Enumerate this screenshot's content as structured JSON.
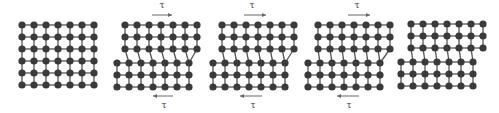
{
  "figure": {
    "stress_symbol": "τ",
    "colors": {
      "atom": "#3a3a3a",
      "bond": "#555555",
      "arrow": "#666666",
      "background": "#ffffff"
    },
    "atom_radius": 3.6,
    "spacing": 12
  },
  "panels": [
    {
      "name": "panel-perfect-lattice",
      "shear": false,
      "top_rows": {
        "x0": 22,
        "y0": 25,
        "cols": 7,
        "rows": 3
      },
      "bottom_rows": {
        "x0": 22,
        "y0": 61,
        "cols": 7,
        "rows": 3
      },
      "extra_half_plane_col": null
    },
    {
      "name": "panel-dislocation-enters",
      "shear": true,
      "tau_top": {
        "label": "τ",
        "x": 162,
        "y": 8,
        "arrow_x1": 152,
        "arrow_x2": 172,
        "arrow_y": 15,
        "dir": "right"
      },
      "tau_bottom": {
        "label": "τ",
        "x": 164,
        "y": 108,
        "arrow_x1": 153,
        "arrow_x2": 173,
        "arrow_y": 96,
        "dir": "left"
      },
      "top_rows": {
        "x0": 125,
        "y0": 25,
        "cols": 7,
        "rows": 3
      },
      "bottom_rows": {
        "x0": 117,
        "y0": 63,
        "cols": 7,
        "rows": 3
      },
      "dislocation_col": 1
    },
    {
      "name": "panel-dislocation-glides",
      "shear": true,
      "tau_top": {
        "label": "τ",
        "x": 252,
        "y": 8,
        "arrow_x1": 244,
        "arrow_x2": 266,
        "arrow_y": 15,
        "dir": "right"
      },
      "tau_bottom": {
        "label": "τ",
        "x": 253,
        "y": 108,
        "arrow_x1": 240,
        "arrow_x2": 262,
        "arrow_y": 96,
        "dir": "left"
      },
      "top_rows": {
        "x0": 222,
        "y0": 25,
        "cols": 7,
        "rows": 3
      },
      "bottom_rows": {
        "x0": 213,
        "y0": 63,
        "cols": 7,
        "rows": 3
      },
      "dislocation_col": 3
    },
    {
      "name": "panel-dislocation-near-exit",
      "shear": true,
      "tau_top": {
        "label": "τ",
        "x": 357,
        "y": 8,
        "arrow_x1": 348,
        "arrow_x2": 370,
        "arrow_y": 15,
        "dir": "right"
      },
      "tau_bottom": {
        "label": "τ",
        "x": 349,
        "y": 108,
        "arrow_x1": 337,
        "arrow_x2": 359,
        "arrow_y": 96,
        "dir": "left"
      },
      "top_rows": {
        "x0": 318,
        "y0": 25,
        "cols": 7,
        "rows": 3
      },
      "bottom_rows": {
        "x0": 308,
        "y0": 63,
        "cols": 7,
        "rows": 3
      },
      "dislocation_col": 5
    },
    {
      "name": "panel-slip-step",
      "shear": false,
      "top_rows": {
        "x0": 411,
        "y0": 24,
        "cols": 7,
        "rows": 3
      },
      "bottom_rows": {
        "x0": 401,
        "y0": 62,
        "cols": 7,
        "rows": 3
      },
      "dislocation_col": null
    }
  ]
}
